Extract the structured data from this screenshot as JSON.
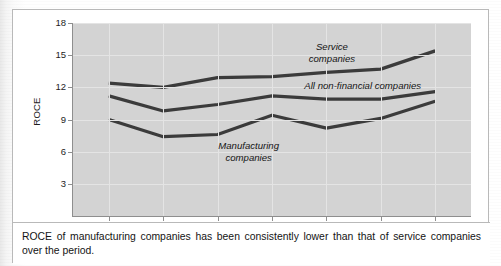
{
  "figure": {
    "caption": "ROCE of manufacturing companies has been consistently lower than that of service companies over the period."
  },
  "chart_data": {
    "type": "line",
    "title": "",
    "xlabel": "",
    "ylabel": "ROCE",
    "categories": [
      "2008",
      "2009",
      "2010",
      "2011",
      "2012",
      "2013",
      "2014"
    ],
    "yticks": [
      "3",
      "6",
      "9",
      "12",
      "15",
      "18"
    ],
    "ylim": [
      0,
      18
    ],
    "xlim": [
      "2008",
      "2014"
    ],
    "grid": true,
    "legend": "inline-annotations",
    "plot_background": "#d3d3d3",
    "line_color": "#3b3b3b",
    "series": [
      {
        "name": "Service companies",
        "label_line1": "Service",
        "label_line2": "companies",
        "values": [
          12.4,
          12.0,
          12.9,
          13.0,
          13.4,
          13.7,
          15.4
        ]
      },
      {
        "name": "All non-financial companies",
        "label_line1": "All non-financial companies",
        "label_line2": "",
        "values": [
          11.2,
          9.8,
          10.4,
          11.2,
          10.9,
          10.9,
          11.6
        ]
      },
      {
        "name": "Manufacturing companies",
        "label_line1": "Manufacturing",
        "label_line2": "companies",
        "values": [
          9.0,
          7.4,
          7.6,
          9.4,
          8.2,
          9.1,
          10.7
        ]
      }
    ]
  }
}
